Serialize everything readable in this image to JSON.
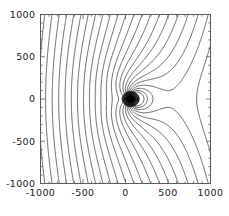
{
  "figure": {
    "kind": "contour-plot",
    "background_color": "#ffffff",
    "frame_color": "#555555",
    "contour_color": "#2b2b2b",
    "label_color": "#1a1a1a"
  },
  "chart_data": {
    "type": "line",
    "plot_style": "contour",
    "title": "",
    "subtitle": "",
    "xlabel": "",
    "ylabel": "",
    "xlim": [
      -1000,
      1000
    ],
    "ylim": [
      -1000,
      1000
    ],
    "grid": false,
    "legend": null,
    "legend_position": "none",
    "x_ticks": [
      -1000,
      -500,
      0,
      500,
      1000
    ],
    "x_tick_labels": [
      "-1000",
      "-500",
      "0",
      "500",
      "1000"
    ],
    "y_ticks": [
      -1000,
      -500,
      0,
      500,
      1000
    ],
    "y_tick_labels": [
      "-1000",
      "-500",
      "0",
      "500",
      "1000"
    ],
    "x_minor_tick_step": 100,
    "y_minor_tick_step": 100,
    "annotations": [],
    "singularity": {
      "label": "point-source",
      "x": 60,
      "y": 0,
      "rendered_as": "dense dark blob of converging contours"
    },
    "saddle": {
      "label": "stagnation-region",
      "x": -330,
      "y": 0
    },
    "contour_count_top_edge": 25,
    "levels": [
      -1.2,
      -1.1,
      -1.0,
      -0.9,
      -0.8,
      -0.7,
      -0.6,
      -0.5,
      -0.4,
      -0.3,
      -0.2,
      -0.1,
      0.0,
      0.1,
      0.2,
      0.3,
      0.4,
      0.5,
      0.6,
      0.7,
      0.8,
      0.9,
      1.0,
      1.1,
      1.2
    ]
  }
}
